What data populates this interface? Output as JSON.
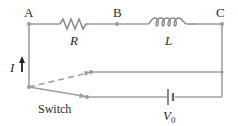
{
  "diagram": {
    "type": "RL circuit with switch",
    "nodes": {
      "a": {
        "label": "A"
      },
      "b": {
        "label": "B"
      },
      "c": {
        "label": "C"
      }
    },
    "components": {
      "resistor": {
        "label": "R"
      },
      "inductor": {
        "label": "L"
      },
      "battery": {
        "label_main": "V",
        "label_sub": "0"
      },
      "switch": {
        "label": "Switch"
      }
    },
    "current": {
      "label": "I"
    },
    "colors": {
      "wire": "#a0a0a0",
      "text": "#2b2b2b",
      "background": "#ffffff"
    }
  }
}
